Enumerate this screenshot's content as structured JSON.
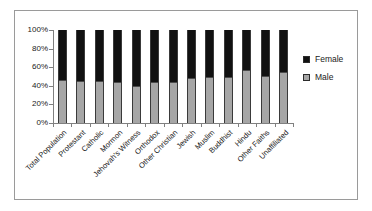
{
  "chart_data": {
    "type": "bar",
    "subtype": "stacked-100-percent",
    "title": "",
    "xlabel": "",
    "ylabel": "",
    "ylim": [
      0,
      100
    ],
    "ytick_labels": [
      "100%",
      "80%",
      "60%",
      "40%",
      "20%",
      "0%"
    ],
    "ytick_values": [
      100,
      80,
      60,
      40,
      20,
      0
    ],
    "grid": false,
    "legend_position": "right",
    "categories": [
      "Total Population",
      "Protestant",
      "Catholic",
      "Mormon",
      "Jehovah's Witness",
      "Orthodox",
      "Other Christian",
      "Jewish",
      "Muslim",
      "Buddhist",
      "Hindu",
      "Other Faiths",
      "Unaffiliated"
    ],
    "series": [
      {
        "name": "Male",
        "color": "#a6a6a6",
        "values": [
          46,
          45,
          45,
          44,
          40,
          44,
          44,
          48,
          50,
          49,
          57,
          51,
          55
        ]
      },
      {
        "name": "Female",
        "color": "#111111",
        "values": [
          54,
          55,
          55,
          56,
          60,
          56,
          56,
          52,
          50,
          51,
          43,
          49,
          45
        ]
      }
    ]
  },
  "legend": {
    "items": [
      {
        "label": "Female",
        "color": "#111111"
      },
      {
        "label": "Male",
        "color": "#a6a6a6"
      }
    ]
  },
  "axes": {
    "y_axis_color": "#808080",
    "x_axis_color": "#808080"
  },
  "frame": {
    "border_color": "#9a9a9a",
    "background": "#ffffff"
  }
}
